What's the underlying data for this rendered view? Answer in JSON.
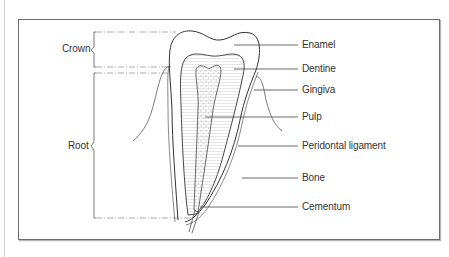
{
  "figure": {
    "regions": [
      {
        "id": "crown",
        "label": "Crown"
      },
      {
        "id": "root",
        "label": "Root"
      }
    ],
    "labels": [
      {
        "id": "enamel",
        "text": "Enamel"
      },
      {
        "id": "dentine",
        "text": "Dentine"
      },
      {
        "id": "gingiva",
        "text": "Gingiva"
      },
      {
        "id": "pulp",
        "text": "Pulp"
      },
      {
        "id": "periodontal",
        "text": "Peridontal ligament"
      },
      {
        "id": "bone",
        "text": "Bone"
      },
      {
        "id": "cementum",
        "text": "Cementum"
      }
    ],
    "colors": {
      "frame": "#6b6b6b",
      "line": "#3a3a3a",
      "text": "#333333",
      "dentine_hatch": "#cfcfcf",
      "pulp_fill": "#f2f2f2"
    }
  }
}
